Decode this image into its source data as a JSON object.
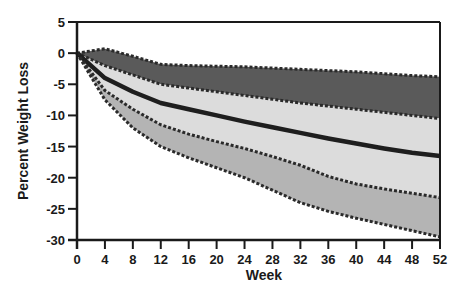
{
  "chart_data": {
    "type": "area",
    "title": "",
    "xlabel": "Week",
    "ylabel": "Percent Weight Loss",
    "xlim": [
      0,
      52
    ],
    "ylim": [
      -30,
      5
    ],
    "xticks": [
      0,
      4,
      8,
      12,
      16,
      20,
      24,
      28,
      32,
      36,
      40,
      44,
      48,
      52
    ],
    "yticks": [
      5,
      0,
      -5,
      -10,
      -15,
      -20,
      -25,
      -30
    ],
    "grid": false,
    "legend": null,
    "series": [
      {
        "name": "Upper bound",
        "style": "dashed",
        "x": [
          0,
          4,
          8,
          12,
          16,
          20,
          24,
          28,
          32,
          36,
          40,
          44,
          48,
          52
        ],
        "values": [
          0,
          0.7,
          -0.5,
          -1.8,
          -2.0,
          -2.1,
          -2.2,
          -2.4,
          -2.6,
          -2.8,
          -3.0,
          -3.3,
          -3.6,
          -3.8
        ]
      },
      {
        "name": "Upper inner bound",
        "style": "dashed",
        "x": [
          0,
          4,
          8,
          12,
          16,
          20,
          24,
          28,
          32,
          36,
          40,
          44,
          48,
          52
        ],
        "values": [
          0,
          -2.0,
          -3.5,
          -5.0,
          -5.6,
          -6.2,
          -6.8,
          -7.4,
          -8.0,
          -8.5,
          -9.0,
          -9.5,
          -10.0,
          -10.5
        ]
      },
      {
        "name": "Mean",
        "style": "solid",
        "x": [
          0,
          4,
          8,
          12,
          16,
          20,
          24,
          28,
          32,
          36,
          40,
          44,
          48,
          52
        ],
        "values": [
          0,
          -4.0,
          -6.2,
          -8.0,
          -9.0,
          -10.0,
          -11.0,
          -11.9,
          -12.8,
          -13.7,
          -14.5,
          -15.3,
          -16.0,
          -16.5
        ]
      },
      {
        "name": "Lower inner bound",
        "style": "dashed",
        "x": [
          0,
          4,
          8,
          12,
          16,
          20,
          24,
          28,
          32,
          36,
          40,
          44,
          48,
          52
        ],
        "values": [
          0,
          -6.0,
          -9.0,
          -11.5,
          -13.0,
          -14.2,
          -15.3,
          -16.6,
          -18.0,
          -19.8,
          -21.0,
          -21.8,
          -22.5,
          -23.2
        ]
      },
      {
        "name": "Lower bound",
        "style": "dashed",
        "x": [
          0,
          4,
          8,
          12,
          16,
          20,
          24,
          28,
          32,
          36,
          40,
          44,
          48,
          52
        ],
        "values": [
          0,
          -7.5,
          -12.0,
          -15.0,
          -16.8,
          -18.4,
          -20.0,
          -22.0,
          -24.0,
          -25.4,
          -26.5,
          -27.5,
          -28.5,
          -29.5
        ]
      }
    ],
    "bands": [
      {
        "between": [
          "Upper bound",
          "Upper inner bound"
        ],
        "fill": "#5a5a5a"
      },
      {
        "between": [
          "Upper inner bound",
          "Lower inner bound"
        ],
        "fill": "#dcdcdc"
      },
      {
        "between": [
          "Lower inner bound",
          "Lower bound"
        ],
        "fill": "#b4b4b4"
      }
    ],
    "colors": {
      "axis": "#1a1a1a",
      "mean_line": "#1e1e1e",
      "dashed_line": "#2a2a2a"
    }
  }
}
